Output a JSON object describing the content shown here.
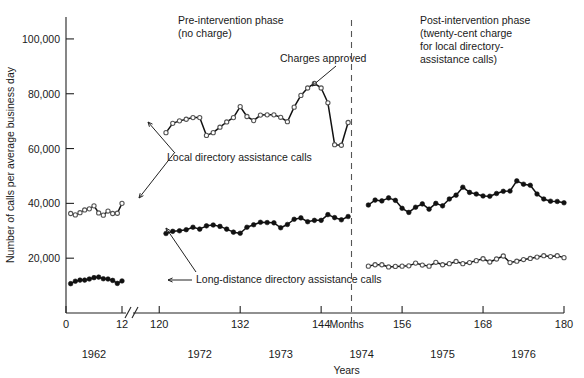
{
  "chart_data": {
    "type": "line",
    "title": "",
    "xlabel": "Months",
    "ylabel": "Number of calls per average business day",
    "secondary_xlabel": "Years",
    "ylim": [
      0,
      108000
    ],
    "yticks": [
      20000,
      40000,
      60000,
      80000,
      100000
    ],
    "ytick_labels": [
      "20,000",
      "40,000",
      "60,000",
      "80,000",
      "100,000"
    ],
    "xticks": [
      0,
      12,
      120,
      132,
      144,
      156,
      168,
      180
    ],
    "xtick_labels": [
      "0",
      "12",
      "120",
      "132",
      "144",
      "156",
      "168",
      "180"
    ],
    "axis_break": true,
    "axis_break_after": 12,
    "grid": false,
    "legend_position": "inline-annotations",
    "year_labels": [
      {
        "label": "1962",
        "month": 6
      },
      {
        "label": "1971",
        "month": 18
      },
      {
        "label": "1972",
        "month": 126
      },
      {
        "label": "1973",
        "month": 138
      },
      {
        "label": "1974",
        "month": 150
      },
      {
        "label": "1975",
        "month": 162
      },
      {
        "label": "1976",
        "month": 174
      }
    ],
    "annotations": [
      {
        "name": "pre-intervention-phase",
        "text": "Pre-intervention phase\n(no charge)"
      },
      {
        "name": "post-intervention-phase",
        "text": "Post-intervention phase\n(twenty-cent charge\nfor local directory-\nassistance calls)"
      },
      {
        "name": "charges-approved",
        "text": "Charges approved"
      },
      {
        "name": "local-directory-assistance-calls",
        "text": "Local directory assistance calls"
      },
      {
        "name": "long-distance-directory-assistance-calls",
        "text": "Long-distance directory assistance calls"
      }
    ],
    "intervention_marker_month": 148.5,
    "series": [
      {
        "name": "Local directory assistance calls",
        "marker": "open-circle",
        "segments": [
          {
            "label": "1962",
            "x": [
              1,
              2,
              3,
              4,
              5,
              6,
              7,
              8,
              9,
              10,
              11,
              12
            ],
            "values": [
              36300,
              35800,
              36600,
              37600,
              38000,
              39100,
              36500,
              35700,
              37200,
              36300,
              36400,
              40000
            ]
          },
          {
            "label": "1971-1973",
            "x": [
              121,
              122,
              123,
              124,
              125,
              126,
              127,
              128,
              129,
              130,
              131,
              132,
              133,
              134,
              135,
              136,
              137,
              138,
              139,
              140,
              141,
              142,
              143,
              144,
              145,
              146,
              147,
              148
            ],
            "values": [
              65800,
              69200,
              70100,
              70700,
              71300,
              71300,
              64800,
              65800,
              67800,
              69700,
              71300,
              75300,
              71700,
              70200,
              72200,
              72300,
              72300,
              71400,
              69800,
              75100,
              79400,
              82100,
              83800,
              82100,
              76700,
              61400,
              61200,
              69500,
              66400,
              53900
            ]
          }
        ]
      },
      {
        "name": "Long-distance directory assistance calls",
        "marker": "filled-circle",
        "segments": [
          {
            "label": "1962",
            "x": [
              1,
              2,
              3,
              4,
              5,
              6,
              7,
              8,
              9,
              10,
              11,
              12
            ],
            "values": [
              10700,
              11600,
              12000,
              12000,
              12400,
              12900,
              13100,
              12500,
              12400,
              11900,
              10800,
              11700
            ]
          },
          {
            "label": "1971-1973",
            "x": [
              121,
              122,
              123,
              124,
              125,
              126,
              127,
              128,
              129,
              130,
              131,
              132,
              133,
              134,
              135,
              136,
              137,
              138,
              139,
              140,
              141,
              142,
              143,
              144,
              145,
              146,
              147,
              148
            ],
            "values": [
              29000,
              29800,
              30000,
              30400,
              31300,
              30600,
              31800,
              32100,
              31600,
              30600,
              29500,
              29100,
              31300,
              32200,
              33100,
              33000,
              32900,
              31100,
              32300,
              34200,
              34700,
              33300,
              33800,
              33800,
              35900,
              34800,
              34000,
              35200,
              35400,
              37900
            ]
          }
        ]
      },
      {
        "name": "Long-distance directory assistance calls (post)",
        "marker": "filled-circle",
        "segments": [
          {
            "label": "1974-1976",
            "x": [
              151,
              152,
              153,
              154,
              155,
              156,
              157,
              158,
              159,
              160,
              161,
              162,
              163,
              164,
              165,
              166,
              167,
              168,
              169,
              170,
              171,
              172,
              173,
              174,
              175,
              176,
              177,
              178,
              179,
              180
            ],
            "values": [
              39400,
              41200,
              40900,
              42000,
              41100,
              38200,
              36700,
              38600,
              39800,
              37900,
              40000,
              39100,
              41600,
              43000,
              45900,
              44000,
              43400,
              42700,
              42600,
              43600,
              44400,
              44500,
              48200,
              47000,
              46600,
              43400,
              41600,
              40800,
              40700,
              40200
            ]
          }
        ]
      },
      {
        "name": "Local directory assistance calls (post)",
        "marker": "open-circle",
        "segments": [
          {
            "label": "1974-1976",
            "x": [
              151,
              152,
              153,
              154,
              155,
              156,
              157,
              158,
              159,
              160,
              161,
              162,
              163,
              164,
              165,
              166,
              167,
              168,
              169,
              170,
              171,
              172,
              173,
              174,
              175,
              176,
              177,
              178,
              179,
              180
            ],
            "values": [
              17100,
              17600,
              17600,
              16800,
              17000,
              17100,
              17200,
              18200,
              17500,
              17100,
              18500,
              17600,
              18000,
              18800,
              18000,
              18400,
              19100,
              19800,
              18600,
              19700,
              20800,
              18400,
              18900,
              19500,
              19900,
              20400,
              20900,
              20600,
              20900,
              20200
            ]
          }
        ]
      }
    ]
  }
}
